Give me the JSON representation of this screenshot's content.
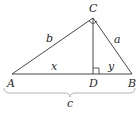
{
  "diagram": {
    "type": "right-triangle-with-altitude",
    "vertices": {
      "A": {
        "label": "A"
      },
      "B": {
        "label": "B"
      },
      "C": {
        "label": "C"
      },
      "D": {
        "label": "D"
      }
    },
    "sides": {
      "b": "b",
      "a": "a",
      "x": "x",
      "y": "y",
      "c": "c"
    },
    "colors": {
      "stroke": "#333333",
      "brace": "#aaaaaa",
      "text": "#2a2a2a"
    }
  }
}
